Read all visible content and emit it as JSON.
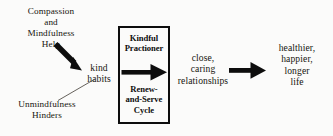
{
  "diagram": {
    "background_color": "#fbfbfa",
    "ink_color": "#17150f",
    "nodes": {
      "compassion_help": "Compassion\nand\nMindfulness\nHelp",
      "kind_habits": "kind\nhabits",
      "unmindfulness_hinders": "Unmindfulness\nHinders",
      "kindful_practioner": "Kindful\nPractioner",
      "renew_and_serve_cycle": "Renew-\nand-Serve\nCycle",
      "relationships": "close,\ncaring\nrelationships",
      "outcome": "healthier,\nhappier,\nlonger\nlife"
    },
    "connectors": [
      {
        "name": "compassion-to-kind-habits-arrow",
        "style": "thick-solid-arrow",
        "direction": "down-right",
        "from": "compassion_help",
        "to": "kind_habits"
      },
      {
        "name": "unmindfulness-to-kind-habits-line",
        "style": "thin-line-no-head",
        "direction": "up-right",
        "from": "unmindfulness_hinders",
        "to": "kind_habits"
      },
      {
        "name": "practitioner-cycle-arrow",
        "style": "thick-solid-arrow",
        "direction": "right",
        "from": "kindful_practioner",
        "to": "renew_and_serve_cycle"
      },
      {
        "name": "relationships-to-outcome-arrow",
        "style": "thick-solid-arrow",
        "direction": "right",
        "from": "relationships",
        "to": "outcome"
      }
    ]
  }
}
